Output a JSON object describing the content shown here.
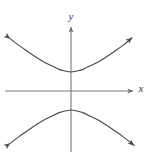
{
  "figure": {
    "name": "hyperbola-graph",
    "background_color": "#ffffff",
    "curve_color": "#4a4a4a",
    "axis_color": "#7a7a7a",
    "label_color": "#3a3a3a"
  },
  "axes": {
    "x_label": "x",
    "y_label": "y",
    "x_label_position": {
      "x": 141,
      "y": 92
    },
    "y_label_position": {
      "x": 71,
      "y": 20
    },
    "x_axis": {
      "x1": 5,
      "y1": 91,
      "x2": 133,
      "y2": 91,
      "arrow_end": "right"
    },
    "y_axis": {
      "x1": 71,
      "y1": 152,
      "x2": 71,
      "y2": 27,
      "arrow_end": "top"
    }
  },
  "chart_data": {
    "type": "line",
    "title": "",
    "subtitle": "",
    "xlabel": "x",
    "ylabel": "y",
    "grid": false,
    "legend": null,
    "origin_px": {
      "x": 71,
      "y": 91
    },
    "px_per_unit": {
      "x": 20,
      "y": 20
    },
    "xlim": [
      -3.3,
      3.1
    ],
    "ylim": [
      -3.05,
      3.2
    ],
    "equation": "y^2/a^2 - x^2/b^2 = 1",
    "orientation": "vertical transverse axis",
    "center": [
      0,
      0
    ],
    "a": 0.95,
    "b": 1.2,
    "vertices": [
      [
        0,
        0.95
      ],
      [
        0,
        -0.95
      ]
    ],
    "asymptote_slopes": [
      0.79,
      -0.79
    ],
    "arrow_tips_px": [
      {
        "id": "upper-left",
        "x": 13,
        "y": 28
      },
      {
        "id": "upper-right",
        "x": 133,
        "y": 27
      },
      {
        "id": "lower-left",
        "x": 13,
        "y": 152
      },
      {
        "id": "lower-right",
        "x": 135,
        "y": 152
      }
    ],
    "series": [
      {
        "name": "upper-branch",
        "points": [
          [
            -3.05,
            2.62
          ],
          [
            -2.6,
            2.28
          ],
          [
            -2.2,
            2.0
          ],
          [
            -1.8,
            1.73
          ],
          [
            -1.4,
            1.48
          ],
          [
            -1.0,
            1.28
          ],
          [
            -0.6,
            1.08
          ],
          [
            -0.3,
            1.0
          ],
          [
            0.0,
            0.95
          ],
          [
            0.3,
            1.0
          ],
          [
            0.6,
            1.08
          ],
          [
            1.0,
            1.28
          ],
          [
            1.4,
            1.48
          ],
          [
            1.8,
            1.73
          ],
          [
            2.2,
            2.0
          ],
          [
            2.6,
            2.28
          ],
          [
            3.05,
            2.66
          ]
        ]
      },
      {
        "name": "lower-branch",
        "points": [
          [
            -3.05,
            -2.62
          ],
          [
            -2.6,
            -2.28
          ],
          [
            -2.2,
            -2.0
          ],
          [
            -1.8,
            -1.73
          ],
          [
            -1.4,
            -1.48
          ],
          [
            -1.0,
            -1.28
          ],
          [
            -0.6,
            -1.08
          ],
          [
            -0.3,
            -1.0
          ],
          [
            0.0,
            -0.95
          ],
          [
            0.3,
            -1.0
          ],
          [
            0.6,
            -1.08
          ],
          [
            1.0,
            -1.28
          ],
          [
            1.4,
            -1.48
          ],
          [
            1.8,
            -1.73
          ],
          [
            2.2,
            -2.0
          ],
          [
            2.6,
            -2.28
          ],
          [
            3.15,
            -2.72
          ]
        ]
      }
    ]
  }
}
